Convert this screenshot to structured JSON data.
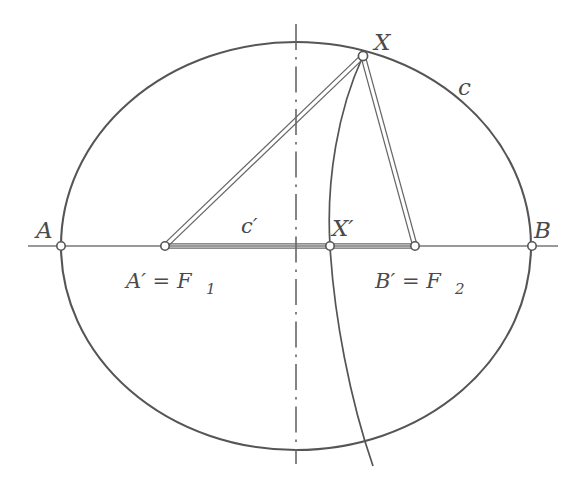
{
  "figure": {
    "background_color": "#ffffff",
    "stroke_color": "#555555",
    "label_color": "#4a4a4a",
    "width": 571,
    "height": 480
  },
  "labels": {
    "ellipse": "c",
    "arc": "c′",
    "point_a": "A",
    "point_b": "B",
    "point_x": "X",
    "point_x_prime": "X′",
    "focus_1_text": "A′ = F",
    "focus_1_sub": "1",
    "focus_2_text": "B′ = F",
    "focus_2_sub": "2",
    "a_prime": "A′",
    "b_prime": "B′",
    "equals": "=",
    "f_letter": "F"
  },
  "geometry": {
    "ellipse": {
      "cx": 296,
      "cy": 246,
      "rx": 235,
      "ry": 204
    },
    "axis_horizontal": {
      "x1": 28,
      "y1": 246,
      "x2": 558,
      "y2": 246
    },
    "axis_vertical": {
      "x": 296,
      "y1": 24,
      "y2": 464
    },
    "points": [
      {
        "name": "A",
        "x": 61,
        "y": 246
      },
      {
        "name": "A′ = F1",
        "x": 165,
        "y": 246
      },
      {
        "name": "X′",
        "x": 330,
        "y": 246
      },
      {
        "name": "B′ = F2",
        "x": 415,
        "y": 246
      },
      {
        "name": "B",
        "x": 532,
        "y": 246
      },
      {
        "name": "X",
        "x": 363,
        "y": 56
      }
    ],
    "segments": [
      {
        "from": "X",
        "to": "A′",
        "style": "double"
      },
      {
        "from": "X",
        "to": "B′",
        "style": "double"
      },
      {
        "from": "A′",
        "to": "B′",
        "style": "double"
      }
    ],
    "arc": {
      "description": "circular arc c′ through X and X′ extending past the ellipse",
      "start": {
        "x": 363,
        "y": 56
      },
      "through": {
        "x": 330,
        "y": 246
      },
      "end": {
        "x": 373,
        "y": 466
      }
    }
  },
  "label_positions": {
    "ellipse_c": {
      "x": 458,
      "y": 95
    },
    "arc_c_prime": {
      "x": 241,
      "y": 233
    },
    "point_a": {
      "x": 36,
      "y": 238
    },
    "point_b": {
      "x": 534,
      "y": 238
    },
    "point_x": {
      "x": 374,
      "y": 50
    },
    "point_x_prime": {
      "x": 332,
      "y": 236
    },
    "focus_1": {
      "x": 126,
      "y": 288
    },
    "focus_2": {
      "x": 375,
      "y": 288
    }
  }
}
